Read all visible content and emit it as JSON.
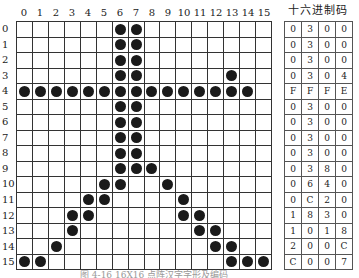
{
  "figure": {
    "col_labels": [
      "0",
      "1",
      "2",
      "3",
      "4",
      "5",
      "6",
      "7",
      "8",
      "9",
      "10",
      "11",
      "12",
      "13",
      "14",
      "15"
    ],
    "row_labels": [
      "0",
      "1",
      "2",
      "3",
      "4",
      "5",
      "6",
      "7",
      "8",
      "9",
      "10",
      "11",
      "12",
      "13",
      "14",
      "15"
    ],
    "hex_title": "十六进制码",
    "hex_rows": [
      [
        "0",
        "3",
        "0",
        "0"
      ],
      [
        "0",
        "3",
        "0",
        "0"
      ],
      [
        "0",
        "3",
        "0",
        "0"
      ],
      [
        "0",
        "3",
        "0",
        "4"
      ],
      [
        "F",
        "F",
        "F",
        "E"
      ],
      [
        "0",
        "3",
        "0",
        "0"
      ],
      [
        "0",
        "3",
        "0",
        "0"
      ],
      [
        "0",
        "3",
        "0",
        "0"
      ],
      [
        "0",
        "3",
        "0",
        "0"
      ],
      [
        "0",
        "3",
        "8",
        "0"
      ],
      [
        "0",
        "6",
        "4",
        "0"
      ],
      [
        "0",
        "C",
        "2",
        "0"
      ],
      [
        "1",
        "8",
        "3",
        "0"
      ],
      [
        "1",
        "0",
        "1",
        "8"
      ],
      [
        "2",
        "0",
        "0",
        "C"
      ],
      [
        "C",
        "0",
        "0",
        "7"
      ]
    ],
    "dots": [
      [
        6,
        7
      ],
      [
        6,
        7
      ],
      [
        6,
        7
      ],
      [
        6,
        7,
        13
      ],
      [
        0,
        1,
        2,
        3,
        4,
        5,
        6,
        7,
        8,
        9,
        10,
        11,
        12,
        13,
        14
      ],
      [
        6,
        7
      ],
      [
        6,
        7
      ],
      [
        6,
        7
      ],
      [
        6,
        7
      ],
      [
        6,
        7,
        8
      ],
      [
        5,
        6,
        9
      ],
      [
        4,
        5,
        10
      ],
      [
        3,
        4,
        10,
        11
      ],
      [
        3,
        11,
        12
      ],
      [
        2,
        12,
        13
      ],
      [
        0,
        1,
        13,
        14,
        15
      ]
    ],
    "caption": "图 4-16  16X16 点阵汉字字形及编码"
  }
}
